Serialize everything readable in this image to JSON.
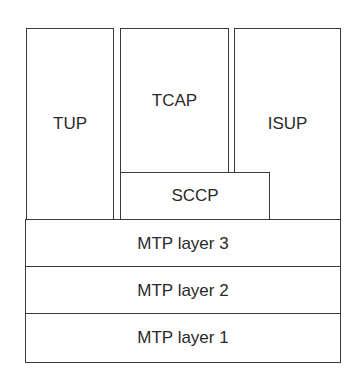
{
  "diagram": {
    "layers": {
      "tup": "TUP",
      "tcap": "TCAP",
      "isup": "ISUP",
      "sccp": "SCCP",
      "mtp3": "MTP layer 3",
      "mtp2": "MTP layer 2",
      "mtp1": "MTP layer 1"
    },
    "colors": {
      "stroke": "#3a3a3a",
      "fill": "#ffffff",
      "text": "#2a2a2a"
    }
  }
}
